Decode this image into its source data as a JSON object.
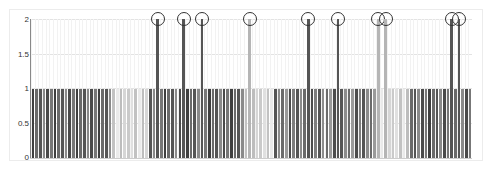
{
  "chart_data": {
    "type": "bar",
    "title": "",
    "xlabel": "",
    "ylabel": "",
    "ylim": [
      0,
      2
    ],
    "yticks": [
      "0",
      "0.5",
      "1",
      "1.5",
      "2"
    ],
    "grid": true,
    "legend": null,
    "bar_count": 120,
    "highlighted_value": 2,
    "highlight_marker": "circle",
    "groups": [
      {
        "x_start": 0,
        "x_end": 22,
        "value": 1,
        "shade": "dark"
      },
      {
        "x_start": 22,
        "x_end": 32,
        "value": 1,
        "shade": "light"
      },
      {
        "x_start": 32,
        "x_end": 58,
        "value": 1,
        "shade": "dark",
        "spikes_to_2": [
          34,
          41,
          46
        ]
      },
      {
        "x_start": 58,
        "x_end": 66,
        "value": 1,
        "shade": "light",
        "spikes_to_2": [
          59
        ]
      },
      {
        "x_start": 66,
        "x_end": 94,
        "value": 1,
        "shade": "mid-dark",
        "spikes_to_2": [
          75,
          83
        ]
      },
      {
        "x_start": 94,
        "x_end": 103,
        "value": 1,
        "shade": "light",
        "spikes_to_2": [
          94,
          96
        ]
      },
      {
        "x_start": 103,
        "x_end": 120,
        "value": 1,
        "shade": "dark",
        "spikes_to_2": [
          114,
          116
        ]
      }
    ],
    "values_summary": "All bars have value 1 except 10 highlighted bars at value 2 (circled)"
  },
  "colors": {
    "dark": "#4a4a4a",
    "mid": "#7a7a7a",
    "light": "#c8c8c8",
    "circle": "#333333",
    "grid": "#e3e3e3"
  }
}
